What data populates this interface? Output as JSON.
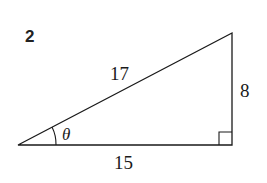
{
  "problem": {
    "number": "2"
  },
  "triangle": {
    "hypotenuse": "17",
    "opposite": "8",
    "adjacent": "15",
    "angle_label": "θ",
    "right_angle_marker": true,
    "line_color": "#1a1a1a"
  }
}
